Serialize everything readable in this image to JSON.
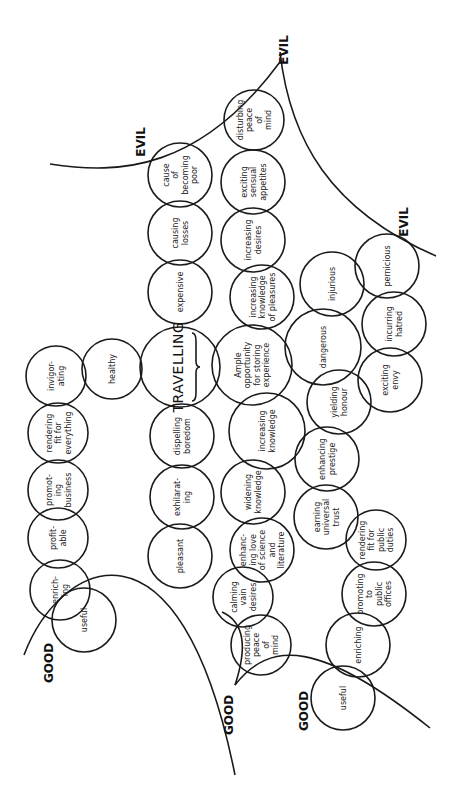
{
  "diagram": {
    "title": "TRAVELLING",
    "labels": {
      "evil_top": "EVIL",
      "evil_corner": "EVIL",
      "evil_right": "EVIL",
      "good_left": "GOOD",
      "good_middle": "GOOD",
      "good_bottom": "GOOD"
    },
    "nodes": [
      {
        "id": "cause-of-becoming-poor",
        "lines": [
          "cause",
          "of",
          "becoming",
          "poor"
        ],
        "cx": 180,
        "cy": 175,
        "r": 32
      },
      {
        "id": "causing-losses",
        "lines": [
          "causing",
          "losses"
        ],
        "cx": 180,
        "cy": 233,
        "r": 32
      },
      {
        "id": "expensive",
        "lines": [
          "expensive"
        ],
        "cx": 180,
        "cy": 292,
        "r": 32
      },
      {
        "id": "travelling",
        "lines": [
          "TRAVELLING"
        ],
        "cx": 180,
        "cy": 367,
        "r": 40
      },
      {
        "id": "dispelling-boredom",
        "lines": [
          "dispelling",
          "boredom"
        ],
        "cx": 182,
        "cy": 436,
        "r": 32
      },
      {
        "id": "exhilarating",
        "lines": [
          "exhilarat-",
          "ing"
        ],
        "cx": 182,
        "cy": 497,
        "r": 32
      },
      {
        "id": "pleasant",
        "lines": [
          "pleasant"
        ],
        "cx": 180,
        "cy": 556,
        "r": 32
      },
      {
        "id": "healthy",
        "lines": [
          "healthy"
        ],
        "cx": 112,
        "cy": 369,
        "r": 30
      },
      {
        "id": "invigorating",
        "lines": [
          "invigor-",
          "ating"
        ],
        "cx": 56,
        "cy": 376,
        "r": 30
      },
      {
        "id": "rendering-fit-for-everything",
        "lines": [
          "rendering",
          "fit for",
          "everything"
        ],
        "cx": 58,
        "cy": 433,
        "r": 30
      },
      {
        "id": "promoting-business",
        "lines": [
          "promot-",
          "ing",
          "business"
        ],
        "cx": 58,
        "cy": 490,
        "r": 30
      },
      {
        "id": "profitable",
        "lines": [
          "profit-",
          "able"
        ],
        "cx": 58,
        "cy": 538,
        "r": 30
      },
      {
        "id": "enriching-top",
        "lines": [
          "enrich-",
          "ing"
        ],
        "cx": 60,
        "cy": 590,
        "r": 30
      },
      {
        "id": "useful-top",
        "lines": [
          "useful"
        ],
        "cx": 84,
        "cy": 620,
        "r": 32
      },
      {
        "id": "disturbing-peace-of-mind",
        "lines": [
          "disturbing",
          "peace",
          "of",
          "mind"
        ],
        "cx": 254,
        "cy": 120,
        "r": 30
      },
      {
        "id": "exciting-sensual-appetites",
        "lines": [
          "exciting",
          "sensual",
          "appetites"
        ],
        "cx": 253,
        "cy": 182,
        "r": 32
      },
      {
        "id": "increasing-desires",
        "lines": [
          "increasing",
          "desires"
        ],
        "cx": 253,
        "cy": 240,
        "r": 32
      },
      {
        "id": "increasing-knowledge-of-pleasures",
        "lines": [
          "increasing",
          "knowledge",
          "of  pleasures"
        ],
        "cx": 262,
        "cy": 297,
        "r": 32
      },
      {
        "id": "ample-opportunity",
        "lines": [
          "Ample",
          "opportunity",
          "for  storing",
          "experience"
        ],
        "cx": 252,
        "cy": 365,
        "r": 40
      },
      {
        "id": "increasing-knowledge",
        "lines": [
          "increasing",
          "knowledge"
        ],
        "cx": 267,
        "cy": 431,
        "r": 38
      },
      {
        "id": "widening-knowledge",
        "lines": [
          "widening",
          "knowledge"
        ],
        "cx": 253,
        "cy": 492,
        "r": 32
      },
      {
        "id": "enhancing-love-of-science",
        "lines": [
          "enhanc-",
          "ing love",
          "of science",
          "and",
          "literature"
        ],
        "cx": 262,
        "cy": 550,
        "r": 32
      },
      {
        "id": "calming-vain-desires",
        "lines": [
          "calming",
          "vain",
          "desires"
        ],
        "cx": 243,
        "cy": 597,
        "r": 30
      },
      {
        "id": "producing-peace-of-mind",
        "lines": [
          "producing",
          "peace",
          "of",
          "mind"
        ],
        "cx": 261,
        "cy": 645,
        "r": 30
      },
      {
        "id": "injurious",
        "lines": [
          "injurious"
        ],
        "cx": 332,
        "cy": 284,
        "r": 32
      },
      {
        "id": "pernicious",
        "lines": [
          "pernicious"
        ],
        "cx": 387,
        "cy": 266,
        "r": 32
      },
      {
        "id": "incurring-hatred",
        "lines": [
          "incurring",
          "hatred"
        ],
        "cx": 394,
        "cy": 324,
        "r": 32
      },
      {
        "id": "dangerous",
        "lines": [
          "dangerous"
        ],
        "cx": 323,
        "cy": 347,
        "r": 38
      },
      {
        "id": "exciting-envy",
        "lines": [
          "exciting",
          "envy"
        ],
        "cx": 390,
        "cy": 380,
        "r": 32
      },
      {
        "id": "yielding-honour",
        "lines": [
          "yielding",
          "honour"
        ],
        "cx": 339,
        "cy": 402,
        "r": 32
      },
      {
        "id": "enhancing-prestige",
        "lines": [
          "enhancing",
          "prestige"
        ],
        "cx": 327,
        "cy": 459,
        "r": 32
      },
      {
        "id": "earning-universal-trust",
        "lines": [
          "earning",
          "universal",
          "trust"
        ],
        "cx": 326,
        "cy": 517,
        "r": 32
      },
      {
        "id": "rendering-fit-for-public-duties",
        "lines": [
          "rendering",
          "fit  for",
          "public",
          "duties"
        ],
        "cx": 376,
        "cy": 540,
        "r": 30
      },
      {
        "id": "promoting-to-public-offices",
        "lines": [
          "promoting",
          "to",
          "public",
          "offices"
        ],
        "cx": 374,
        "cy": 594,
        "r": 32
      },
      {
        "id": "enriching-bottom",
        "lines": [
          "enriching"
        ],
        "cx": 358,
        "cy": 645,
        "r": 32
      },
      {
        "id": "useful-bottom",
        "lines": [
          "useful"
        ],
        "cx": 343,
        "cy": 698,
        "r": 32
      }
    ]
  }
}
